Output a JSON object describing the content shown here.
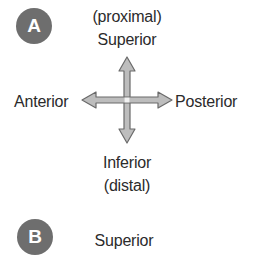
{
  "panel_a": {
    "badge": "A",
    "top_sub": "(proximal)",
    "top": "Superior",
    "left": "Anterior",
    "right": "Posterior",
    "bottom": "Inferior",
    "bottom_sub": "(distal)"
  },
  "panel_b": {
    "badge": "B",
    "top": "Superior"
  },
  "colors": {
    "badge": "#6e6e6e",
    "arrow_fill": "#bdbdbd",
    "arrow_stroke": "#6a6a6a",
    "text": "#2b2b2b"
  }
}
